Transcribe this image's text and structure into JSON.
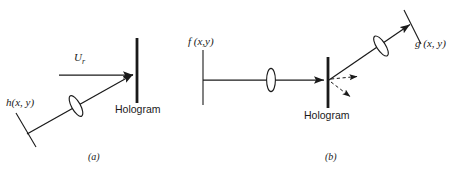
{
  "figure": {
    "background_color": "#ffffff",
    "ink_color": "#1a1a1a",
    "width": 459,
    "height": 178,
    "panels": [
      {
        "id": "a",
        "caption": "(a)",
        "caption_x": 88,
        "caption_y": 157,
        "description": "Hologram recording geometry",
        "labels": {
          "reference_beam": "U",
          "reference_beam_subscript": "r",
          "object_beam": "h(x, y)",
          "plate": "Hologram"
        },
        "label_positions": {
          "reference_beam_x": 74,
          "reference_beam_y": 58,
          "object_beam_x": 6,
          "object_beam_y": 102,
          "plate_x": 117,
          "plate_y": 104
        },
        "elements": {
          "hologram_plate": {
            "x": 137,
            "y_top": 38,
            "y_bottom": 103,
            "stroke_width": 2.6
          },
          "reference_ray": {
            "x1": 59,
            "y1": 75,
            "x2": 135,
            "y2": 75,
            "arrow": true
          },
          "object_ray": {
            "x1": 27,
            "y1": 134,
            "x2": 135,
            "y2": 74,
            "arrow": true
          },
          "object_lens": {
            "cx": 76,
            "cy": 106,
            "rx": 4.4,
            "ry": 11.5,
            "rotation_deg": -29
          },
          "object_plane": {
            "x1": 16,
            "y1": 113,
            "x2": 36,
            "y2": 147
          }
        }
      },
      {
        "id": "b",
        "caption": "(b)",
        "caption_x": 325,
        "caption_y": 157,
        "description": "Hologram reconstruction geometry",
        "labels": {
          "input_plane": "f (x,y)",
          "output_plane": "g (x, y)",
          "plate": "Hologram"
        },
        "label_positions": {
          "input_plane_x": 188,
          "input_plane_y": 41,
          "output_plane_x": 417,
          "output_plane_y": 41,
          "plate_x": 306,
          "plate_y": 113
        },
        "elements": {
          "hologram_plate": {
            "x": 328,
            "y_top": 57,
            "y_bottom": 108,
            "stroke_width": 2.6
          },
          "input_plane_line": {
            "x": 203,
            "y_top": 50,
            "y_bottom": 105
          },
          "input_ray": {
            "x1": 203,
            "y1": 80,
            "x2": 326,
            "y2": 80,
            "arrow": true
          },
          "input_lens": {
            "cx": 271,
            "cy": 80,
            "rx": 4.4,
            "ry": 11.5,
            "rotation_deg": 0
          },
          "diffracted_ray": {
            "x1": 329,
            "y1": 80,
            "x2": 412,
            "y2": 23,
            "arrow": true
          },
          "output_lens": {
            "cx": 381,
            "cy": 46,
            "rx": 4.4,
            "ry": 11.5,
            "rotation_deg": -33
          },
          "output_plane_line": {
            "x1": 404,
            "y1": 10,
            "x2": 421,
            "y2": 44
          },
          "dashed_order_1": {
            "x1": 331,
            "y1": 80,
            "x2": 359,
            "y2": 77,
            "arrow": true,
            "dashed": true
          },
          "dashed_order_2": {
            "x1": 331,
            "y1": 82,
            "x2": 352,
            "y2": 98,
            "arrow": true,
            "dashed": true
          }
        }
      }
    ]
  }
}
